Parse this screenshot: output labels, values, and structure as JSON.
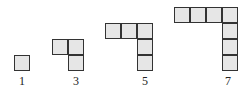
{
  "figure": {
    "cell_fill": "#e6e6e6",
    "cell_border": "#333333",
    "cell_size": 16,
    "shapes": [
      {
        "label": "1",
        "cells": [
          [
            0,
            0
          ]
        ],
        "origin": [
          14,
          55
        ],
        "label_pos": [
          12,
          75
        ]
      },
      {
        "label": "3",
        "cells": [
          [
            0,
            0
          ],
          [
            1,
            0
          ],
          [
            1,
            1
          ]
        ],
        "origin": [
          52,
          39
        ],
        "label_pos": [
          66,
          75
        ]
      },
      {
        "label": "5",
        "cells": [
          [
            0,
            0
          ],
          [
            1,
            0
          ],
          [
            2,
            0
          ],
          [
            2,
            1
          ],
          [
            2,
            2
          ]
        ],
        "origin": [
          105,
          23
        ],
        "label_pos": [
          135,
          75
        ]
      },
      {
        "label": "7",
        "cells": [
          [
            0,
            0
          ],
          [
            1,
            0
          ],
          [
            2,
            0
          ],
          [
            3,
            0
          ],
          [
            3,
            1
          ],
          [
            3,
            2
          ],
          [
            3,
            3
          ]
        ],
        "origin": [
          174,
          7
        ],
        "label_pos": [
          218,
          75
        ]
      }
    ]
  }
}
